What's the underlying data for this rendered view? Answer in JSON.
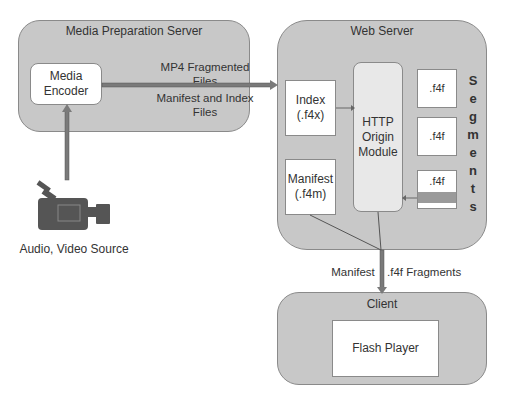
{
  "media_prep_server": {
    "title": "Media Preparation Server",
    "encoder": {
      "line1": "Media",
      "line2": "Encoder"
    },
    "arrow_label_top": {
      "line1": "MP4 Fragmented",
      "line2": "Files"
    },
    "arrow_label_bottom": {
      "line1": "Manifest and Index",
      "line2": "Files"
    }
  },
  "source": {
    "label": "Audio, Video Source",
    "icon": "video-camera-icon"
  },
  "web_server": {
    "title": "Web Server",
    "index": {
      "line1": "Index",
      "line2": "(.f4x)"
    },
    "manifest": {
      "line1": "Manifest",
      "line2": "(.f4m)"
    },
    "origin": {
      "line1": "HTTP",
      "line2": "Origin",
      "line3": "Module"
    },
    "segments": [
      ".f4f",
      ".f4f",
      ".f4f"
    ],
    "segments_label": [
      "S",
      "e",
      "g",
      "m",
      "e",
      "n",
      "t",
      "s"
    ]
  },
  "transfer": {
    "left_label": "Manifest",
    "right_label": ".f4f Fragments"
  },
  "client": {
    "title": "Client",
    "player": "Flash Player"
  },
  "colors": {
    "panel": "#c8c8c8",
    "border": "#8a8a8a",
    "arrow": "#7a7a7a",
    "segment_bar": "#9a9a9a"
  }
}
